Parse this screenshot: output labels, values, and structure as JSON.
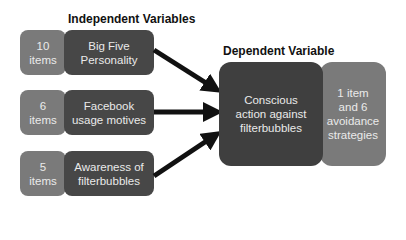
{
  "independent": {
    "heading": "Independent Variables",
    "rows": [
      {
        "count": "10 items",
        "count_line1": "10",
        "count_line2": "items",
        "label_line1": "Big Five",
        "label_line2": "Personality"
      },
      {
        "count": "6 items",
        "count_line1": "6",
        "count_line2": "items",
        "label_line1": "Facebook",
        "label_line2": "usage motives"
      },
      {
        "count": "5 items",
        "count_line1": "5",
        "count_line2": "items",
        "label_line1": "Awareness of",
        "label_line2": "filterbubbles"
      }
    ]
  },
  "dependent": {
    "heading": "Dependent Variable",
    "label_lines": [
      "Conscious",
      "action against",
      "filterbubbles"
    ],
    "measure_lines": [
      "1 item",
      "and 6",
      "avoidance",
      "strategies"
    ]
  },
  "colors": {
    "light_box": "#7a7a7a",
    "dark_box": "#474747",
    "arrow": "#111111"
  }
}
